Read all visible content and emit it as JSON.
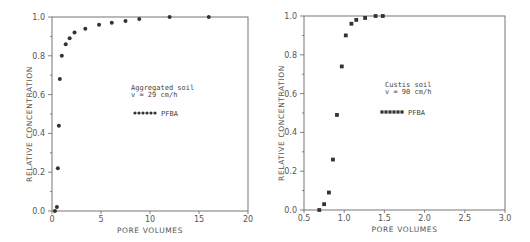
{
  "chart_data": [
    {
      "type": "scatter",
      "title": "",
      "xlabel": "PORE VOLUMES",
      "ylabel": "RELATIVE CONCENTRATION",
      "xlim": [
        0,
        20
      ],
      "ylim": [
        0,
        1.0
      ],
      "xticks": [
        "0",
        "5",
        "10",
        "15",
        "20"
      ],
      "yticks": [
        "0.0",
        "0.2",
        "0.4",
        "0.6",
        "0.8",
        "1.0"
      ],
      "grid": false,
      "annotation": [
        "Aggregated soil",
        "v = 29 cm/h"
      ],
      "legend": [
        {
          "label": "PFBA",
          "marker": "filled-circle"
        }
      ],
      "legend_position": "center-right",
      "series": [
        {
          "name": "PFBA",
          "x": [
            0.3,
            0.5,
            0.6,
            0.7,
            0.8,
            1.0,
            1.4,
            1.8,
            2.3,
            3.4,
            4.8,
            6.1,
            7.5,
            8.9,
            12.0,
            16.0
          ],
          "y": [
            0.0,
            0.02,
            0.22,
            0.44,
            0.68,
            0.8,
            0.86,
            0.89,
            0.92,
            0.94,
            0.96,
            0.97,
            0.98,
            0.99,
            1.0,
            1.0
          ]
        }
      ]
    },
    {
      "type": "scatter",
      "title": "",
      "xlabel": "PORE VOLUMES",
      "ylabel": "RELATIVE CONCENTRATION",
      "xlim": [
        0.5,
        3.0
      ],
      "ylim": [
        0,
        1.0
      ],
      "xticks": [
        "0.5",
        "1.0",
        "1.5",
        "2.0",
        "2.5",
        "3.0"
      ],
      "yticks": [
        "0.0",
        "0.2",
        "0.4",
        "0.6",
        "0.8",
        "1.0"
      ],
      "grid": false,
      "annotation": [
        "Custis soil",
        "v = 90 cm/h"
      ],
      "legend": [
        {
          "label": "PFBA",
          "marker": "filled-square"
        }
      ],
      "legend_position": "center-right",
      "series": [
        {
          "name": "PFBA",
          "x": [
            0.69,
            0.75,
            0.81,
            0.86,
            0.91,
            0.97,
            1.02,
            1.09,
            1.15,
            1.26,
            1.39,
            1.48
          ],
          "y": [
            0.0,
            0.03,
            0.09,
            0.26,
            0.49,
            0.74,
            0.9,
            0.96,
            0.98,
            0.99,
            1.0,
            1.0
          ]
        }
      ]
    }
  ],
  "left_plot": {
    "xlabel": "PORE VOLUMES",
    "ylabel": "RELATIVE CONCENTRATION",
    "annotation_line1": "Aggregated soil",
    "annotation_line2": "v = 29 cm/h",
    "legend_label": "PFBA"
  },
  "right_plot": {
    "xlabel": "PORE VOLUMES",
    "ylabel": "RELATIVE CONCENTRATION",
    "annotation_line1": "Custis soil",
    "annotation_line2": "v = 90 cm/h",
    "legend_label": "PFBA"
  },
  "colors": {
    "ink": "#333333",
    "axis": "#555555",
    "background": "#ffffff"
  }
}
